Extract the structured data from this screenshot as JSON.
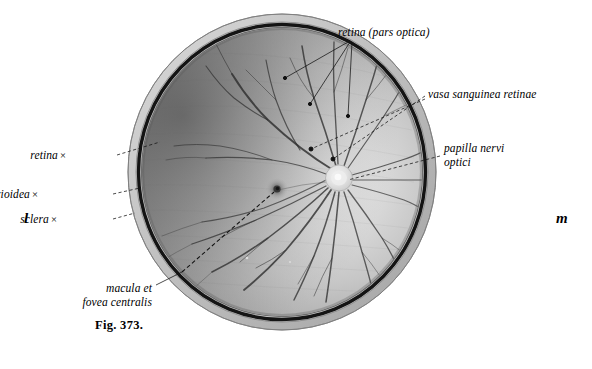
{
  "figure": {
    "caption": "Fig. 373.",
    "background_color": "#ffffff",
    "ink_color": "#000000"
  },
  "orientation_marks": [
    {
      "name": "lateral",
      "text": "l",
      "x": 24,
      "y": 210
    },
    {
      "name": "medial",
      "text": "m",
      "x": 556,
      "y": 210
    }
  ],
  "labels": [
    {
      "id": "retina-pars-optica",
      "lines": [
        "retina (pars optica)"
      ],
      "x": 338,
      "y": 26,
      "align": "left",
      "marker": "",
      "leaders": [
        {
          "from": [
            348,
            42
          ],
          "to": [
            285,
            78
          ]
        },
        {
          "from": [
            350,
            42
          ],
          "to": [
            310,
            104
          ]
        },
        {
          "from": [
            352,
            42
          ],
          "to": [
            348,
            116
          ]
        }
      ]
    },
    {
      "id": "vasa-sanguinea-retinae",
      "lines": [
        "vasa sanguinea retinae"
      ],
      "x": 428,
      "y": 88,
      "align": "left",
      "marker": "",
      "leaders": [
        {
          "from": [
            425,
            96
          ],
          "to": [
            333,
            159
          ]
        },
        {
          "from": [
            425,
            99
          ],
          "to": [
            311,
            149
          ]
        }
      ]
    },
    {
      "id": "papilla-nervi-optici",
      "lines": [
        "papilla nervi",
        "optici"
      ],
      "x": 444,
      "y": 142,
      "align": "left",
      "marker": "",
      "leaders": [
        {
          "from": [
            440,
            156
          ],
          "to": [
            348,
            180
          ]
        }
      ]
    },
    {
      "id": "retina",
      "lines": [
        "retina"
      ],
      "x": 66,
      "y": 149,
      "align": "right",
      "marker": "×",
      "leaders": [
        {
          "from": [
            117,
            155
          ],
          "to": [
            160,
            142
          ]
        }
      ]
    },
    {
      "id": "chorioidea",
      "lines": [
        "chorioidea"
      ],
      "x": 38,
      "y": 188,
      "align": "right",
      "marker": "×",
      "leaders": [
        {
          "from": [
            113,
            194
          ],
          "to": [
            140,
            188
          ]
        }
      ]
    },
    {
      "id": "sclera",
      "lines": [
        "sclera"
      ],
      "x": 57,
      "y": 213,
      "align": "right",
      "marker": "×",
      "leaders": [
        {
          "from": [
            113,
            219
          ],
          "to": [
            135,
            213
          ]
        }
      ]
    },
    {
      "id": "macula-et-fovea-centralis",
      "lines": [
        "macula et",
        "fovea centralis"
      ],
      "x": 152,
      "y": 282,
      "align": "right",
      "marker": "",
      "leaders": [
        {
          "from": [
            156,
            285
          ],
          "to": [
            182,
            272
          ]
        }
      ]
    }
  ],
  "anatomy": {
    "globe": {
      "cx": 282,
      "cy": 172,
      "rx": 154,
      "ry": 158
    },
    "optic_disc": {
      "name": "papilla-nervi-optici",
      "cx": 339,
      "cy": 178,
      "r": 13
    },
    "macula": {
      "name": "macula-fovea-centralis",
      "cx": 277,
      "cy": 189,
      "r": 10
    },
    "layers": [
      {
        "name": "sclera",
        "color": "#c9c9c9"
      },
      {
        "name": "chorioidea",
        "color": "#151515"
      },
      {
        "name": "retina",
        "color": "#9a9a9a"
      }
    ]
  }
}
